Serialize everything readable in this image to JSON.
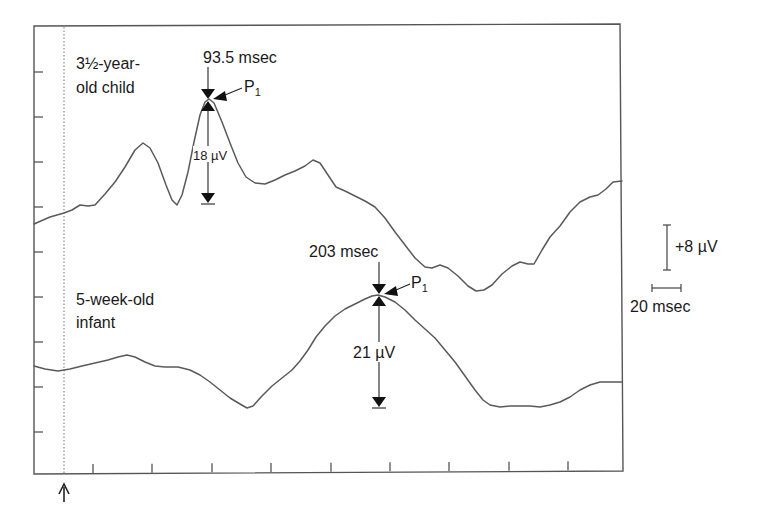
{
  "chart_data": {
    "type": "line",
    "title": "",
    "xlabel": "",
    "ylabel": "",
    "grid": false,
    "legend": "none (inline labels)",
    "x_units": "msec",
    "y_units": "µV (positive up)",
    "stimulus_onset_marker": "arrow at stimulus onset (dotted vertical line)",
    "scale_bars": {
      "voltage": "+8 µV",
      "time": "20 msec"
    },
    "series": [
      {
        "name": "3½-year-old child",
        "label_lines": [
          "3½-year-",
          "old child"
        ],
        "peak": {
          "name": "P1",
          "latency": "93.5 msec",
          "amplitude": "18 µV"
        },
        "points_px": [
          [
            34,
            224
          ],
          [
            50,
            217
          ],
          [
            64,
            213
          ],
          [
            72,
            210
          ],
          [
            80,
            205
          ],
          [
            88,
            206
          ],
          [
            95,
            205
          ],
          [
            105,
            194
          ],
          [
            115,
            182
          ],
          [
            125,
            167
          ],
          [
            135,
            150
          ],
          [
            143,
            143
          ],
          [
            150,
            148
          ],
          [
            158,
            163
          ],
          [
            166,
            185
          ],
          [
            172,
            200
          ],
          [
            177,
            205
          ],
          [
            182,
            195
          ],
          [
            188,
            172
          ],
          [
            194,
            142
          ],
          [
            200,
            115
          ],
          [
            205,
            102
          ],
          [
            209,
            99
          ],
          [
            214,
            103
          ],
          [
            222,
            122
          ],
          [
            230,
            143
          ],
          [
            238,
            163
          ],
          [
            246,
            177
          ],
          [
            255,
            183
          ],
          [
            265,
            184
          ],
          [
            275,
            180
          ],
          [
            285,
            175
          ],
          [
            295,
            171
          ],
          [
            305,
            166
          ],
          [
            313,
            160
          ],
          [
            320,
            163
          ],
          [
            328,
            175
          ],
          [
            336,
            187
          ],
          [
            345,
            191
          ],
          [
            355,
            196
          ],
          [
            365,
            201
          ],
          [
            375,
            207
          ],
          [
            385,
            218
          ],
          [
            395,
            232
          ],
          [
            405,
            245
          ],
          [
            415,
            258
          ],
          [
            425,
            267
          ],
          [
            432,
            268
          ],
          [
            440,
            265
          ],
          [
            448,
            268
          ],
          [
            458,
            276
          ],
          [
            468,
            286
          ],
          [
            476,
            291
          ],
          [
            484,
            290
          ],
          [
            492,
            285
          ],
          [
            502,
            274
          ],
          [
            512,
            266
          ],
          [
            520,
            262
          ],
          [
            528,
            264
          ],
          [
            534,
            264
          ],
          [
            542,
            250
          ],
          [
            550,
            237
          ],
          [
            560,
            226
          ],
          [
            570,
            212
          ],
          [
            580,
            202
          ],
          [
            590,
            197
          ],
          [
            598,
            195
          ],
          [
            606,
            189
          ],
          [
            613,
            182
          ],
          [
            622,
            181
          ]
        ]
      },
      {
        "name": "5-week-old infant",
        "label_lines": [
          "5-week-old",
          "infant"
        ],
        "peak": {
          "name": "P1",
          "latency": "203 msec",
          "amplitude": "21 µV"
        },
        "points_px": [
          [
            34,
            366
          ],
          [
            45,
            369
          ],
          [
            58,
            371
          ],
          [
            70,
            369
          ],
          [
            82,
            366
          ],
          [
            95,
            363
          ],
          [
            108,
            360
          ],
          [
            118,
            357
          ],
          [
            127,
            355
          ],
          [
            135,
            357
          ],
          [
            145,
            362
          ],
          [
            155,
            366
          ],
          [
            165,
            367
          ],
          [
            178,
            367
          ],
          [
            190,
            370
          ],
          [
            200,
            375
          ],
          [
            210,
            382
          ],
          [
            220,
            390
          ],
          [
            230,
            398
          ],
          [
            240,
            404
          ],
          [
            247,
            408
          ],
          [
            253,
            406
          ],
          [
            262,
            396
          ],
          [
            272,
            386
          ],
          [
            282,
            378
          ],
          [
            292,
            370
          ],
          [
            300,
            361
          ],
          [
            308,
            350
          ],
          [
            316,
            337
          ],
          [
            325,
            326
          ],
          [
            335,
            316
          ],
          [
            345,
            309
          ],
          [
            355,
            304
          ],
          [
            365,
            299
          ],
          [
            372,
            296
          ],
          [
            378,
            295
          ],
          [
            385,
            297
          ],
          [
            395,
            302
          ],
          [
            405,
            310
          ],
          [
            415,
            320
          ],
          [
            425,
            329
          ],
          [
            435,
            338
          ],
          [
            445,
            350
          ],
          [
            455,
            362
          ],
          [
            465,
            376
          ],
          [
            475,
            390
          ],
          [
            483,
            400
          ],
          [
            490,
            405
          ],
          [
            500,
            407
          ],
          [
            510,
            406
          ],
          [
            520,
            406
          ],
          [
            530,
            406
          ],
          [
            540,
            407
          ],
          [
            550,
            405
          ],
          [
            560,
            402
          ],
          [
            570,
            397
          ],
          [
            580,
            390
          ],
          [
            590,
            385
          ],
          [
            600,
            382
          ],
          [
            622,
            382
          ]
        ]
      }
    ]
  },
  "labels": {
    "child_line1": "3½-year-",
    "child_line2": "old child",
    "child_latency": "93.5 msec",
    "child_peak": "P",
    "child_peak_sub": "1",
    "child_amplitude": "18 µV",
    "infant_line1": "5-week-old",
    "infant_line2": "infant",
    "infant_latency": "203 msec",
    "infant_peak": "P",
    "infant_peak_sub": "1",
    "infant_amplitude": "21 µV",
    "voltage_scale": "+8 µV",
    "time_scale": "20 msec",
    "onset_arrow": "↑"
  },
  "axes": {
    "frame": {
      "left": 34,
      "top": 25,
      "right": 622,
      "bottom": 473
    },
    "y_ticks_px": [
      72,
      117,
      162,
      207,
      252,
      297,
      342,
      387,
      432
    ],
    "x_ticks_px": [
      93,
      152,
      212,
      271,
      331,
      390,
      449,
      509,
      568
    ],
    "onset_x": 64
  }
}
